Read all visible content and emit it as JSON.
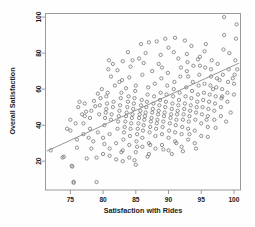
{
  "chart_data": {
    "type": "scatter",
    "title": "",
    "xlabel": "Satisfaction with Rides",
    "ylabel": "Overall Satisfaction",
    "xlim": [
      71.2,
      101.0
    ],
    "ylim": [
      4.0,
      102.0
    ],
    "xticks": [
      75,
      80,
      85,
      90,
      95,
      100
    ],
    "yticks": [
      20,
      40,
      60,
      80,
      100
    ],
    "grid": false,
    "legend": null,
    "marker": "open-circle",
    "marker_color": "#6f6f6f",
    "frame_color": "#9a9a9a",
    "trendline": {
      "type": "linear-fit",
      "color": "#8a8a8a",
      "x_start": 71.4,
      "y_start": 25.6,
      "x_end": 100.8,
      "y_end": 74.5
    },
    "points": [
      [
        72.0,
        26.0
      ],
      [
        73.8,
        22.0
      ],
      [
        74.0,
        22.5
      ],
      [
        75.0,
        37.0
      ],
      [
        75.0,
        43.0
      ],
      [
        75.2,
        17.5
      ],
      [
        75.3,
        17.0
      ],
      [
        75.5,
        8.0
      ],
      [
        75.5,
        8.6
      ],
      [
        76.0,
        27.5
      ],
      [
        76.0,
        32.0
      ],
      [
        76.2,
        50.0
      ],
      [
        76.4,
        53.0
      ],
      [
        77.0,
        35.0
      ],
      [
        77.0,
        41.0
      ],
      [
        77.2,
        45.0
      ],
      [
        77.4,
        47.5
      ],
      [
        77.5,
        21.5
      ],
      [
        78.0,
        38.0
      ],
      [
        78.0,
        44.0
      ],
      [
        78.2,
        48.0
      ],
      [
        78.5,
        31.0
      ],
      [
        78.6,
        53.5
      ],
      [
        79.0,
        8.4
      ],
      [
        79.0,
        22.0
      ],
      [
        79.2,
        36.0
      ],
      [
        79.4,
        46.0
      ],
      [
        79.5,
        51.0
      ],
      [
        79.6,
        55.0
      ],
      [
        80.0,
        24.0
      ],
      [
        80.0,
        33.0
      ],
      [
        80.2,
        40.0
      ],
      [
        80.3,
        44.0
      ],
      [
        80.4,
        47.0
      ],
      [
        80.5,
        49.0
      ],
      [
        80.6,
        52.0
      ],
      [
        80.7,
        58.0
      ],
      [
        80.8,
        71.0
      ],
      [
        80.9,
        76.0
      ],
      [
        81.0,
        27.0
      ],
      [
        81.0,
        35.0
      ],
      [
        81.2,
        43.0
      ],
      [
        81.3,
        46.0
      ],
      [
        81.5,
        50.0
      ],
      [
        81.6,
        53.0
      ],
      [
        81.8,
        62.0
      ],
      [
        82.0,
        21.0
      ],
      [
        82.0,
        30.0
      ],
      [
        82.2,
        38.0
      ],
      [
        82.3,
        42.0
      ],
      [
        82.4,
        45.0
      ],
      [
        82.5,
        48.0
      ],
      [
        82.6,
        51.0
      ],
      [
        82.7,
        55.0
      ],
      [
        82.8,
        58.0
      ],
      [
        82.9,
        65.0
      ],
      [
        83.0,
        20.0
      ],
      [
        83.0,
        26.0
      ],
      [
        83.1,
        32.0
      ],
      [
        83.2,
        36.0
      ],
      [
        83.3,
        39.0
      ],
      [
        83.4,
        42.0
      ],
      [
        83.5,
        45.0
      ],
      [
        83.6,
        47.0
      ],
      [
        83.7,
        50.0
      ],
      [
        83.8,
        53.0
      ],
      [
        83.9,
        56.0
      ],
      [
        84.0,
        22.0
      ],
      [
        84.0,
        29.0
      ],
      [
        84.1,
        34.0
      ],
      [
        84.2,
        38.0
      ],
      [
        84.3,
        41.0
      ],
      [
        84.4,
        44.0
      ],
      [
        84.5,
        46.0
      ],
      [
        84.6,
        49.0
      ],
      [
        84.7,
        52.0
      ],
      [
        84.8,
        55.0
      ],
      [
        84.9,
        59.0
      ],
      [
        85.0,
        18.0
      ],
      [
        85.0,
        25.0
      ],
      [
        85.1,
        31.0
      ],
      [
        85.2,
        35.0
      ],
      [
        85.3,
        38.0
      ],
      [
        85.4,
        41.0
      ],
      [
        85.5,
        44.0
      ],
      [
        85.6,
        46.0
      ],
      [
        85.7,
        48.0
      ],
      [
        85.8,
        51.0
      ],
      [
        85.9,
        54.0
      ],
      [
        86.0,
        28.0
      ],
      [
        86.0,
        33.0
      ],
      [
        86.1,
        37.0
      ],
      [
        86.2,
        40.0
      ],
      [
        86.3,
        43.0
      ],
      [
        86.4,
        45.0
      ],
      [
        86.5,
        47.0
      ],
      [
        86.6,
        50.0
      ],
      [
        86.7,
        53.0
      ],
      [
        86.8,
        57.0
      ],
      [
        86.9,
        61.0
      ],
      [
        87.0,
        24.0
      ],
      [
        87.0,
        30.0
      ],
      [
        87.1,
        36.0
      ],
      [
        87.2,
        39.0
      ],
      [
        87.3,
        42.0
      ],
      [
        87.4,
        44.0
      ],
      [
        87.5,
        47.0
      ],
      [
        87.6,
        49.0
      ],
      [
        87.7,
        52.0
      ],
      [
        87.8,
        56.0
      ],
      [
        87.9,
        63.0
      ],
      [
        88.0,
        27.0
      ],
      [
        88.0,
        34.0
      ],
      [
        88.1,
        38.0
      ],
      [
        88.2,
        41.0
      ],
      [
        88.3,
        43.0
      ],
      [
        88.4,
        46.0
      ],
      [
        88.5,
        48.0
      ],
      [
        88.6,
        51.0
      ],
      [
        88.7,
        54.0
      ],
      [
        88.8,
        58.0
      ],
      [
        88.9,
        66.0
      ],
      [
        89.0,
        29.0
      ],
      [
        89.0,
        35.0
      ],
      [
        89.1,
        39.0
      ],
      [
        89.2,
        42.0
      ],
      [
        89.3,
        45.0
      ],
      [
        89.4,
        47.0
      ],
      [
        89.5,
        50.0
      ],
      [
        89.6,
        53.0
      ],
      [
        89.7,
        57.0
      ],
      [
        89.8,
        62.0
      ],
      [
        89.9,
        69.0
      ],
      [
        90.0,
        26.0
      ],
      [
        90.0,
        33.0
      ],
      [
        90.1,
        37.0
      ],
      [
        90.2,
        41.0
      ],
      [
        90.3,
        44.0
      ],
      [
        90.4,
        46.0
      ],
      [
        90.5,
        49.0
      ],
      [
        90.6,
        52.0
      ],
      [
        90.7,
        56.0
      ],
      [
        90.8,
        60.0
      ],
      [
        90.9,
        64.0
      ],
      [
        91.0,
        31.0
      ],
      [
        91.0,
        36.0
      ],
      [
        91.1,
        40.0
      ],
      [
        91.2,
        43.0
      ],
      [
        91.3,
        46.0
      ],
      [
        91.4,
        48.0
      ],
      [
        91.5,
        51.0
      ],
      [
        91.6,
        54.0
      ],
      [
        91.7,
        58.0
      ],
      [
        91.8,
        67.0
      ],
      [
        91.9,
        72.0
      ],
      [
        92.0,
        28.0
      ],
      [
        92.0,
        35.0
      ],
      [
        92.1,
        39.0
      ],
      [
        92.2,
        43.0
      ],
      [
        92.3,
        46.0
      ],
      [
        92.4,
        49.0
      ],
      [
        92.5,
        52.0
      ],
      [
        92.6,
        56.0
      ],
      [
        92.7,
        61.0
      ],
      [
        92.8,
        70.0
      ],
      [
        92.9,
        75.0
      ],
      [
        93.0,
        32.0
      ],
      [
        93.0,
        38.0
      ],
      [
        93.1,
        42.0
      ],
      [
        93.2,
        45.0
      ],
      [
        93.3,
        48.0
      ],
      [
        93.4,
        51.0
      ],
      [
        93.5,
        55.0
      ],
      [
        93.6,
        59.0
      ],
      [
        93.7,
        64.0
      ],
      [
        93.8,
        73.0
      ],
      [
        94.0,
        30.0
      ],
      [
        94.0,
        37.0
      ],
      [
        94.1,
        43.0
      ],
      [
        94.2,
        47.0
      ],
      [
        94.3,
        50.0
      ],
      [
        94.4,
        53.0
      ],
      [
        94.5,
        57.0
      ],
      [
        94.6,
        62.0
      ],
      [
        94.7,
        68.0
      ],
      [
        94.8,
        78.0
      ],
      [
        95.0,
        34.0
      ],
      [
        95.0,
        41.0
      ],
      [
        95.1,
        46.0
      ],
      [
        95.2,
        50.0
      ],
      [
        95.3,
        54.0
      ],
      [
        95.4,
        58.0
      ],
      [
        95.5,
        63.0
      ],
      [
        95.6,
        72.0
      ],
      [
        95.7,
        85.0
      ],
      [
        96.0,
        39.0
      ],
      [
        96.0,
        45.0
      ],
      [
        96.1,
        49.0
      ],
      [
        96.2,
        53.0
      ],
      [
        96.3,
        57.0
      ],
      [
        96.4,
        62.0
      ],
      [
        96.5,
        67.0
      ],
      [
        96.6,
        76.0
      ],
      [
        97.0,
        43.0
      ],
      [
        97.0,
        48.0
      ],
      [
        97.1,
        52.0
      ],
      [
        97.2,
        56.0
      ],
      [
        97.3,
        61.0
      ],
      [
        97.4,
        66.0
      ],
      [
        97.5,
        74.0
      ],
      [
        98.0,
        45.0
      ],
      [
        98.0,
        50.0
      ],
      [
        98.1,
        55.0
      ],
      [
        98.2,
        60.0
      ],
      [
        98.3,
        68.0
      ],
      [
        98.4,
        82.0
      ],
      [
        98.5,
        90.0
      ],
      [
        98.5,
        100.0
      ],
      [
        99.0,
        53.0
      ],
      [
        99.0,
        58.0
      ],
      [
        99.1,
        64.0
      ],
      [
        99.2,
        71.0
      ],
      [
        99.3,
        80.0
      ],
      [
        100.0,
        57.0
      ],
      [
        100.0,
        63.0
      ],
      [
        100.1,
        68.0
      ],
      [
        100.2,
        76.0
      ],
      [
        100.3,
        88.0
      ],
      [
        100.4,
        96.0
      ],
      [
        86.5,
        80.0
      ],
      [
        87.0,
        86.0
      ],
      [
        88.2,
        86.5
      ],
      [
        89.5,
        88.0
      ],
      [
        91.0,
        88.5
      ],
      [
        92.5,
        87.0
      ],
      [
        84.5,
        76.0
      ],
      [
        85.5,
        77.0
      ],
      [
        83.0,
        75.5
      ],
      [
        81.5,
        74.0
      ],
      [
        90.0,
        83.0
      ],
      [
        93.5,
        84.0
      ],
      [
        95.5,
        81.0
      ],
      [
        86.0,
        68.0
      ],
      [
        84.0,
        66.5
      ],
      [
        82.5,
        64.0
      ],
      [
        79.8,
        60.0
      ],
      [
        88.5,
        74.0
      ],
      [
        91.5,
        77.0
      ],
      [
        94.5,
        76.5
      ],
      [
        96.5,
        71.0
      ],
      [
        97.8,
        65.0
      ],
      [
        93.0,
        67.0
      ],
      [
        89.0,
        72.0
      ],
      [
        87.5,
        70.0
      ],
      [
        85.0,
        62.0
      ],
      [
        83.5,
        60.5
      ],
      [
        80.5,
        56.0
      ],
      [
        78.8,
        50.5
      ],
      [
        76.8,
        46.0
      ],
      [
        74.5,
        38.0
      ],
      [
        77.8,
        33.0
      ],
      [
        81.0,
        23.0
      ],
      [
        84.8,
        20.5
      ],
      [
        86.8,
        22.5
      ],
      [
        90.5,
        24.0
      ],
      [
        92.2,
        25.5
      ],
      [
        94.2,
        27.0
      ],
      [
        96.0,
        33.5
      ],
      [
        97.2,
        38.5
      ],
      [
        98.8,
        42.0
      ],
      [
        99.5,
        47.0
      ],
      [
        95.8,
        43.0
      ],
      [
        93.2,
        35.0
      ],
      [
        91.2,
        30.0
      ],
      [
        89.2,
        26.5
      ],
      [
        87.2,
        29.0
      ],
      [
        85.2,
        28.0
      ],
      [
        82.8,
        25.0
      ],
      [
        80.2,
        29.5
      ],
      [
        78.2,
        27.0
      ],
      [
        75.8,
        41.0
      ],
      [
        77.2,
        52.0
      ],
      [
        79.2,
        57.5
      ],
      [
        81.2,
        67.0
      ],
      [
        82.2,
        70.5
      ],
      [
        84.2,
        72.5
      ],
      [
        86.2,
        74.5
      ],
      [
        88.8,
        79.0
      ],
      [
        90.8,
        80.5
      ],
      [
        92.8,
        79.5
      ],
      [
        94.8,
        73.0
      ],
      [
        96.8,
        60.0
      ],
      [
        98.2,
        56.0
      ],
      [
        99.8,
        66.0
      ],
      [
        100.5,
        71.0
      ],
      [
        85.8,
        85.0
      ],
      [
        83.8,
        80.5
      ]
    ]
  },
  "axes": {
    "xlabel": "Satisfaction with Rides",
    "ylabel": "Overall Satisfaction",
    "xtick_labels": [
      "75",
      "80",
      "85",
      "90",
      "95",
      "100"
    ],
    "ytick_labels": [
      "20",
      "40",
      "60",
      "80",
      "100"
    ]
  }
}
